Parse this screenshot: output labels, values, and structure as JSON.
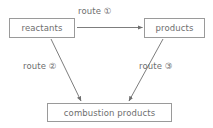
{
  "diagram": {
    "type": "flow-diagram",
    "background_color": "#ffffff",
    "stroke_color": "#9a9a9a",
    "text_color": "#6e6e6e",
    "nodes": [
      {
        "id": "reactants",
        "label": "reactants"
      },
      {
        "id": "products",
        "label": "products"
      },
      {
        "id": "combustion_products",
        "label": "combustion products"
      }
    ],
    "edges": [
      {
        "id": "route_1",
        "label": "route ①",
        "from": "reactants",
        "to": "products",
        "direction": "horizontal-right"
      },
      {
        "id": "route_2",
        "label": "route ②",
        "from": "reactants",
        "to": "combustion_products",
        "direction": "diagonal-down-right"
      },
      {
        "id": "route_3",
        "label": "route ③",
        "from": "products",
        "to": "combustion_products",
        "direction": "diagonal-down-left"
      }
    ]
  }
}
